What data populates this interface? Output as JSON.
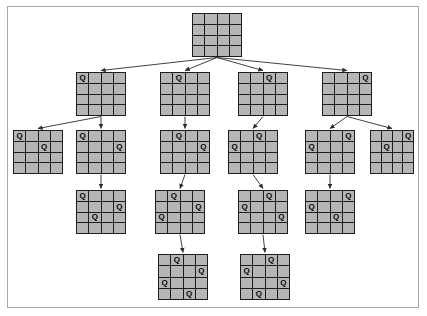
{
  "diagram": {
    "grid_size": 4,
    "queen_glyph": "Q",
    "colors": {
      "background": "#ffffff",
      "frame_border": "#a8a8a8",
      "board_line": "#1d1d1d",
      "cell_fill": "#b6b6b6",
      "edge_stroke": "#2b2b2b",
      "queen_text": "#000000"
    },
    "levels": [
      {
        "level": 1,
        "label": "root-empty-board",
        "nodes": [
          {
            "id": "n0",
            "x": 192,
            "y": 13,
            "w": 50,
            "h": 44,
            "queens": []
          }
        ]
      },
      {
        "level": 2,
        "label": "first-queen-placements",
        "nodes": [
          {
            "id": "n1",
            "x": 76,
            "y": 72,
            "w": 50,
            "h": 44,
            "queens": [
              [
                1,
                1
              ]
            ]
          },
          {
            "id": "n2",
            "x": 160,
            "y": 72,
            "w": 50,
            "h": 44,
            "queens": [
              [
                1,
                2
              ]
            ]
          },
          {
            "id": "n3",
            "x": 238,
            "y": 72,
            "w": 50,
            "h": 44,
            "queens": [
              [
                1,
                3
              ]
            ]
          },
          {
            "id": "n4",
            "x": 322,
            "y": 72,
            "w": 50,
            "h": 44,
            "queens": [
              [
                1,
                4
              ]
            ]
          }
        ]
      },
      {
        "level": 3,
        "label": "second-queen-placements",
        "nodes": [
          {
            "id": "n5",
            "x": 13,
            "y": 130,
            "w": 50,
            "h": 44,
            "queens": [
              [
                1,
                1
              ],
              [
                2,
                3
              ]
            ]
          },
          {
            "id": "n6",
            "x": 76,
            "y": 130,
            "w": 50,
            "h": 44,
            "queens": [
              [
                1,
                1
              ],
              [
                2,
                4
              ]
            ]
          },
          {
            "id": "n7",
            "x": 160,
            "y": 130,
            "w": 50,
            "h": 44,
            "queens": [
              [
                1,
                2
              ],
              [
                2,
                4
              ]
            ]
          },
          {
            "id": "n8",
            "x": 228,
            "y": 130,
            "w": 50,
            "h": 44,
            "queens": [
              [
                1,
                3
              ],
              [
                2,
                1
              ]
            ]
          },
          {
            "id": "n9",
            "x": 305,
            "y": 130,
            "w": 50,
            "h": 44,
            "queens": [
              [
                1,
                4
              ],
              [
                2,
                1
              ]
            ]
          },
          {
            "id": "n10",
            "x": 370,
            "y": 130,
            "w": 44,
            "h": 44,
            "queens": [
              [
                1,
                4
              ],
              [
                2,
                2
              ]
            ]
          }
        ]
      },
      {
        "level": 4,
        "label": "third-queen-placements",
        "nodes": [
          {
            "id": "n11",
            "x": 76,
            "y": 190,
            "w": 50,
            "h": 44,
            "queens": [
              [
                1,
                1
              ],
              [
                2,
                4
              ],
              [
                3,
                2
              ]
            ]
          },
          {
            "id": "n12",
            "x": 155,
            "y": 190,
            "w": 50,
            "h": 44,
            "queens": [
              [
                1,
                2
              ],
              [
                2,
                4
              ],
              [
                3,
                1
              ]
            ]
          },
          {
            "id": "n13",
            "x": 238,
            "y": 190,
            "w": 50,
            "h": 44,
            "queens": [
              [
                1,
                3
              ],
              [
                2,
                1
              ],
              [
                3,
                4
              ]
            ]
          },
          {
            "id": "n14",
            "x": 305,
            "y": 190,
            "w": 50,
            "h": 44,
            "queens": [
              [
                1,
                4
              ],
              [
                2,
                1
              ],
              [
                3,
                3
              ]
            ]
          }
        ]
      },
      {
        "level": 5,
        "label": "complete-solutions",
        "nodes": [
          {
            "id": "n15",
            "x": 158,
            "y": 254,
            "w": 50,
            "h": 46,
            "queens": [
              [
                1,
                2
              ],
              [
                2,
                4
              ],
              [
                3,
                1
              ],
              [
                4,
                3
              ]
            ]
          },
          {
            "id": "n16",
            "x": 240,
            "y": 254,
            "w": 50,
            "h": 46,
            "queens": [
              [
                1,
                3
              ],
              [
                2,
                1
              ],
              [
                3,
                4
              ],
              [
                4,
                2
              ]
            ]
          }
        ]
      }
    ],
    "edges": [
      {
        "from": "n0",
        "to": "n1"
      },
      {
        "from": "n0",
        "to": "n2"
      },
      {
        "from": "n0",
        "to": "n3"
      },
      {
        "from": "n0",
        "to": "n4"
      },
      {
        "from": "n1",
        "to": "n5"
      },
      {
        "from": "n1",
        "to": "n6"
      },
      {
        "from": "n2",
        "to": "n7"
      },
      {
        "from": "n3",
        "to": "n8"
      },
      {
        "from": "n4",
        "to": "n9"
      },
      {
        "from": "n4",
        "to": "n10"
      },
      {
        "from": "n6",
        "to": "n11"
      },
      {
        "from": "n7",
        "to": "n12"
      },
      {
        "from": "n8",
        "to": "n13"
      },
      {
        "from": "n9",
        "to": "n14"
      },
      {
        "from": "n12",
        "to": "n15"
      },
      {
        "from": "n13",
        "to": "n16"
      }
    ]
  }
}
